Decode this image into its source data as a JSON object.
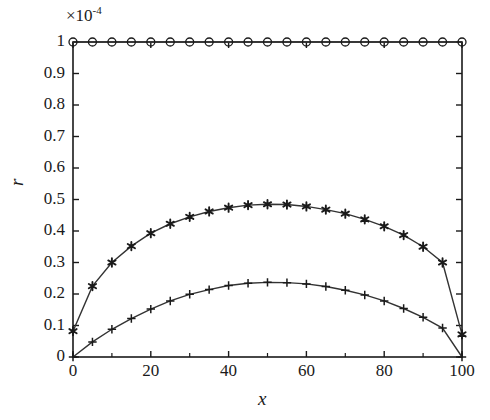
{
  "figure": {
    "background": "#ffffff",
    "axis_color": "#1a1a1a",
    "line_color": "#333333",
    "marker_color": "#1a1a1a"
  },
  "chart_data": {
    "type": "line",
    "title": "",
    "subtitle": "",
    "xlabel": "x",
    "ylabel": "r",
    "y_exponent_label": "×10⁻⁴",
    "y_exponent_base": "×10",
    "y_exponent_power": "-4",
    "xlim": [
      0,
      100
    ],
    "ylim": [
      0,
      1
    ],
    "grid": false,
    "legend": "none",
    "xticks": [
      0,
      20,
      40,
      60,
      80,
      100
    ],
    "xtick_labels": [
      "0",
      "20",
      "40",
      "60",
      "80",
      "100"
    ],
    "x_minor_ticks": [
      10,
      30,
      50,
      70,
      90
    ],
    "yticks": [
      0,
      0.1,
      0.2,
      0.3,
      0.4,
      0.5,
      0.6,
      0.7,
      0.8,
      0.9,
      1
    ],
    "ytick_labels": [
      "0",
      "0.1",
      "0.2",
      "0.3",
      "0.4",
      "0.5",
      "0.6",
      "0.7",
      "0.8",
      "0.9",
      "1"
    ],
    "x": [
      0,
      5,
      10,
      15,
      20,
      25,
      30,
      35,
      40,
      45,
      50,
      55,
      60,
      65,
      70,
      75,
      80,
      85,
      90,
      95,
      100
    ],
    "series": [
      {
        "name": "circle-series",
        "marker": "circle",
        "values": [
          1.0,
          1.0,
          1.0,
          1.0,
          1.0,
          1.0,
          1.0,
          1.0,
          1.0,
          1.0,
          1.0,
          1.0,
          1.0,
          1.0,
          1.0,
          1.0,
          1.0,
          1.0,
          1.0,
          1.0,
          1.0
        ]
      },
      {
        "name": "star-series",
        "marker": "asterisk",
        "values": [
          0.082,
          0.225,
          0.3,
          0.352,
          0.393,
          0.423,
          0.445,
          0.462,
          0.474,
          0.482,
          0.485,
          0.484,
          0.478,
          0.468,
          0.455,
          0.437,
          0.415,
          0.387,
          0.35,
          0.3,
          0.072
        ]
      },
      {
        "name": "plus-series",
        "marker": "plus",
        "values": [
          0.0,
          0.048,
          0.088,
          0.122,
          0.152,
          0.178,
          0.199,
          0.214,
          0.227,
          0.234,
          0.237,
          0.236,
          0.232,
          0.224,
          0.212,
          0.197,
          0.178,
          0.154,
          0.126,
          0.092,
          0.0
        ]
      }
    ]
  }
}
